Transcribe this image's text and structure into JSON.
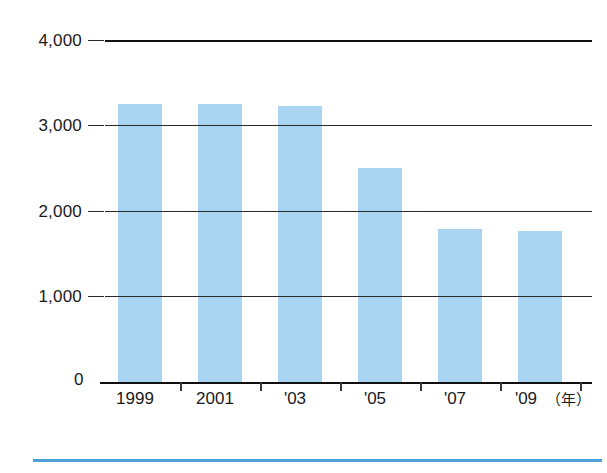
{
  "chart_data": {
    "type": "bar",
    "title": "",
    "subtitle": "",
    "xlabel": "",
    "ylabel": "",
    "unit_note": "（年）",
    "categories": [
      "1999",
      "2001",
      "'03",
      "'05",
      "'07",
      "'09"
    ],
    "values": [
      3250,
      3250,
      3230,
      2500,
      1790,
      1770
    ],
    "ylim": [
      0,
      4000
    ],
    "yticks": [
      0,
      1000,
      2000,
      3000,
      4000
    ],
    "ytick_labels": [
      "0",
      "1,000",
      "2,000",
      "3,000",
      "4,000"
    ],
    "grid": true,
    "grid_axis": "y",
    "legend": null,
    "bar_color": "#a9d5f2",
    "axis_color": "#111111",
    "gridline_color": "#2a2a2a",
    "footer_rule_color": "#4f9fd8",
    "background": "#ffffff",
    "series": [
      {
        "name": "",
        "values": [
          3250,
          3250,
          3230,
          2500,
          1790,
          1770
        ]
      }
    ]
  },
  "axis": {
    "y_labels": [
      "4,000",
      "3,000",
      "2,000",
      "1,000"
    ],
    "zero_label": "0",
    "x_labels": [
      "1999",
      "2001",
      "'03",
      "'05",
      "'07",
      "'09"
    ],
    "unit": "（年）"
  }
}
